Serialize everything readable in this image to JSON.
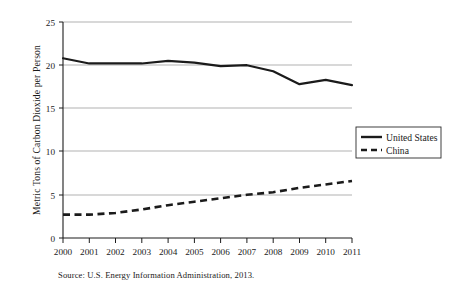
{
  "chart_data": {
    "type": "line",
    "title": "",
    "xlabel": "",
    "ylabel": "Metric Tons of Carbon Dioxide per Person",
    "categories": [
      "2000",
      "2001",
      "2002",
      "2003",
      "2004",
      "2005",
      "2006",
      "2007",
      "2008",
      "2009",
      "2010",
      "2011"
    ],
    "series": [
      {
        "name": "United States",
        "style": "solid",
        "color": "#1b1b1b",
        "values": [
          20.8,
          20.2,
          20.2,
          20.2,
          20.5,
          20.3,
          19.9,
          20.0,
          19.3,
          17.8,
          18.3,
          17.7
        ]
      },
      {
        "name": "China",
        "style": "dashed",
        "color": "#1b1b1b",
        "values": [
          2.7,
          2.7,
          2.9,
          3.3,
          3.8,
          4.2,
          4.6,
          5.0,
          5.3,
          5.8,
          6.2,
          6.6
        ]
      }
    ],
    "ylim": [
      0,
      25
    ],
    "yticks": [
      0,
      5,
      10,
      15,
      20,
      25
    ],
    "ytick_labels": [
      "0",
      "5",
      "10",
      "15",
      "20",
      "25"
    ],
    "grid": "horizontal",
    "legend_position": "center-right-outside"
  },
  "legend": {
    "entries": [
      {
        "label": "United States"
      },
      {
        "label": "China"
      }
    ]
  },
  "source": {
    "text": "Source: U.S. Energy Information Administration, 2013."
  },
  "colors": {
    "line": "#1b1b1b",
    "grid": "#a8a8a8",
    "axis": "#1c1c1c",
    "background": "#ffffff"
  }
}
